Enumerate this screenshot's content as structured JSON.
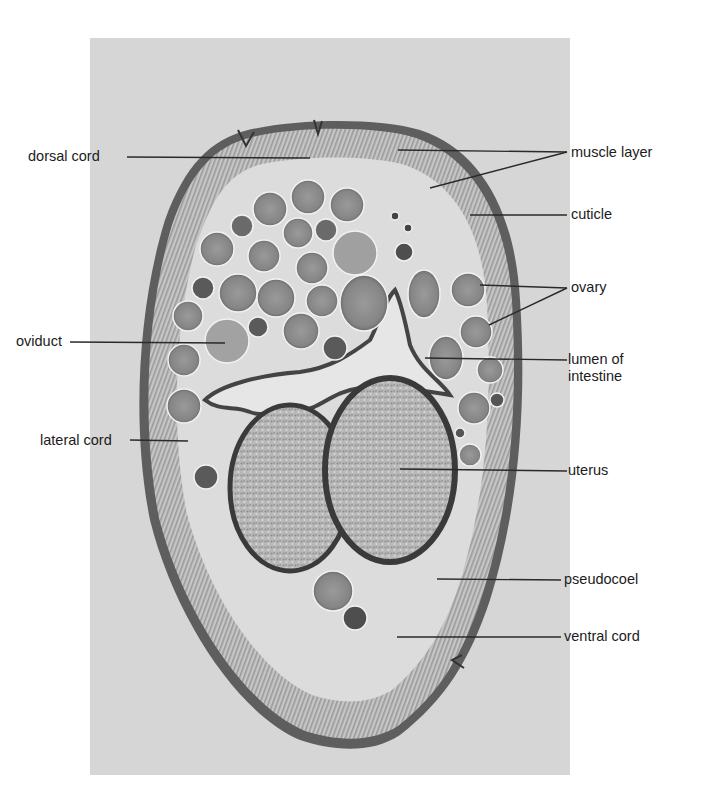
{
  "figure": {
    "colors": {
      "background": "#ffffff",
      "photo_bg": "#d9d9d9",
      "cuticle": "#5a5a5a",
      "muscle": "#a8a8a8",
      "egg": "#8c8c8c",
      "egg_dark": "#4a4a4a",
      "uterus_fill": "#b4b4b4",
      "label_text": "#1c1c1c",
      "leader_line": "#2a2a2a"
    }
  },
  "labels": {
    "left": [
      {
        "id": "dorsal-cord",
        "text": "dorsal cord"
      },
      {
        "id": "oviduct",
        "text": "oviduct"
      },
      {
        "id": "lateral-cord",
        "text": "lateral cord"
      }
    ],
    "right": [
      {
        "id": "muscle-layer",
        "text": "muscle layer"
      },
      {
        "id": "cuticle",
        "text": "cuticle"
      },
      {
        "id": "ovary",
        "text": "ovary"
      },
      {
        "id": "lumen-of-intestine",
        "text": "lumen of intestine",
        "line1": "lumen of",
        "line2": "intestine"
      },
      {
        "id": "uterus",
        "text": "uterus"
      },
      {
        "id": "pseudocoel",
        "text": "pseudocoel"
      },
      {
        "id": "ventral-cord",
        "text": "ventral cord"
      }
    ]
  }
}
